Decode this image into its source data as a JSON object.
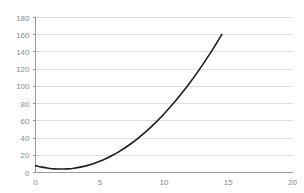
{
  "chart_data": {
    "type": "line",
    "title": "",
    "subtitle": "",
    "xlabel": "",
    "ylabel": "",
    "xlim": [
      0,
      20
    ],
    "ylim": [
      0,
      180
    ],
    "grid": true,
    "grid_axis": "y",
    "legend": false,
    "legend_position": "none",
    "annotations": [],
    "x_ticks": [
      0,
      5,
      10,
      15,
      20
    ],
    "x_tick_labels": [
      "0",
      "5",
      "10",
      "15",
      "20"
    ],
    "y_ticks": [
      0,
      20,
      40,
      60,
      80,
      100,
      120,
      140,
      160,
      180
    ],
    "y_tick_labels": [
      "0",
      "20",
      "40",
      "60",
      "80",
      "100",
      "120",
      "140",
      "160",
      "180"
    ],
    "series": [
      {
        "name": "curve",
        "color": "#1f1f1f",
        "line_width": 1.6,
        "x": [
          0,
          0.5,
          1,
          1.5,
          2,
          2.5,
          3,
          3.5,
          4,
          4.5,
          5,
          5.5,
          6,
          6.5,
          7,
          7.5,
          8,
          8.5,
          9,
          9.5,
          10,
          10.5,
          11,
          11.5,
          12,
          12.5,
          13,
          13.5,
          14,
          14.5
        ],
        "y": [
          8,
          6.25,
          5,
          4.25,
          4,
          4.25,
          5,
          6.25,
          8,
          10.25,
          13,
          16.25,
          20,
          24.25,
          29,
          34.25,
          40,
          46.25,
          53,
          60.25,
          68,
          76.25,
          85,
          94.25,
          104,
          114.25,
          125,
          136.25,
          148,
          160.25
        ]
      }
    ]
  },
  "colors": {
    "background": "#ffffff",
    "gridline": "#d8d8d8",
    "axis": "#9a9a9a",
    "tick_label": "#8a8a8a",
    "series": "#1f1f1f"
  }
}
